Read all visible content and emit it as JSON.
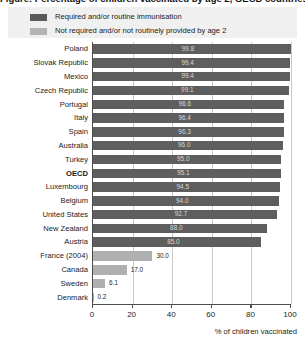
{
  "title": "Figure: Percentage of children vaccinated by age 2, OECD countries",
  "legend": {
    "items": [
      {
        "label": "Required and/or routine immunisation",
        "color": "#595959",
        "icon": "legend-swatch-dark"
      },
      {
        "label": "Not required and/or not routinely provided by age 2",
        "color": "#b3b3b3",
        "icon": "legend-swatch-light"
      }
    ]
  },
  "axis": {
    "x_title": "% of children vaccinated",
    "ticks": [
      "0",
      "20",
      "40",
      "60",
      "80",
      "100"
    ]
  },
  "chart_data": {
    "type": "bar",
    "orientation": "horizontal",
    "title": "Percentage of children vaccinated by age 2",
    "xlabel": "% of children vaccinated",
    "ylabel": "",
    "xlim": [
      0,
      100
    ],
    "grid": true,
    "legend_position": "top",
    "categories": [
      "Poland",
      "Slovak Republic",
      "Mexico",
      "Czech Republic",
      "Portugal",
      "Italy",
      "Spain",
      "Australia",
      "Turkey",
      "OECD",
      "Luxembourg",
      "Belgium",
      "United States",
      "New Zealand",
      "Austria",
      "France (2004)",
      "Canada",
      "Sweden",
      "Denmark"
    ],
    "values": [
      99.8,
      99.4,
      99.4,
      99.1,
      96.6,
      96.4,
      96.3,
      96.0,
      95.0,
      95.1,
      94.5,
      94.0,
      92.7,
      88.0,
      85.0,
      30.0,
      17.0,
      6.1,
      0.2
    ],
    "value_labels": [
      "99.8",
      "99.4",
      "99.4",
      "99.1",
      "96.6",
      "96.4",
      "96.3",
      "96.0",
      "95.0",
      "95.1",
      "94.5",
      "94.0",
      "92.7",
      "88.0",
      "85.0",
      "30.0",
      "17.0",
      "6.1",
      "0.2"
    ],
    "series_group": [
      "required",
      "required",
      "required",
      "required",
      "required",
      "required",
      "required",
      "required",
      "required",
      "required",
      "required",
      "required",
      "required",
      "required",
      "required",
      "not-required",
      "not-required",
      "not-required",
      "not-required"
    ],
    "highlight_category": "OECD",
    "colors": {
      "required": "#5e5e5e",
      "not_required": "#b0b0b0"
    }
  }
}
